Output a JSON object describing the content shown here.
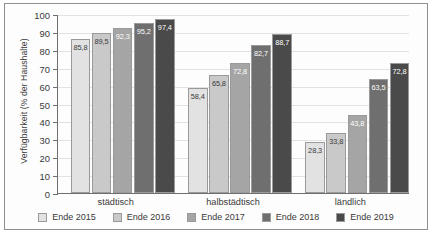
{
  "chart_data": {
    "type": "bar",
    "title": "",
    "xlabel": "",
    "ylabel": "Verfügbarkeit (% der Haushalte)",
    "ylim": [
      0,
      100
    ],
    "ytick_labels": [
      "0",
      "10",
      "20",
      "30",
      "40",
      "50",
      "60",
      "70",
      "80",
      "90",
      "100"
    ],
    "ytick_values": [
      0,
      10,
      20,
      30,
      40,
      50,
      60,
      70,
      80,
      90,
      100
    ],
    "grid": true,
    "legend_position": "bottom",
    "categories": [
      "städtisch",
      "halbstädtisch",
      "ländlich"
    ],
    "series": [
      {
        "name": "Ende 2015",
        "color": "#e2e2e2",
        "label_color": "#3a3a3a",
        "values": [
          85.8,
          58.4,
          28.3
        ],
        "labels": [
          "85,8",
          "58,4",
          "28,3"
        ]
      },
      {
        "name": "Ende 2016",
        "color": "#c9c9c9",
        "label_color": "#3a3a3a",
        "values": [
          89.5,
          65.8,
          33.8
        ],
        "labels": [
          "89,5",
          "65,8",
          "33,8"
        ]
      },
      {
        "name": "Ende 2017",
        "color": "#a5a5a5",
        "label_color": "#ffffff",
        "values": [
          92.3,
          72.8,
          43.8
        ],
        "labels": [
          "92,3",
          "72,8",
          "43,8"
        ]
      },
      {
        "name": "Ende 2018",
        "color": "#6f6f6f",
        "label_color": "#ffffff",
        "values": [
          95.2,
          82.7,
          63.5
        ],
        "labels": [
          "95,2",
          "82,7",
          "63,5"
        ]
      },
      {
        "name": "Ende 2019",
        "color": "#4a4a4a",
        "label_color": "#ffffff",
        "values": [
          97.4,
          88.7,
          72.8
        ],
        "labels": [
          "97,4",
          "88,7",
          "72,8"
        ]
      }
    ]
  },
  "caption": ""
}
